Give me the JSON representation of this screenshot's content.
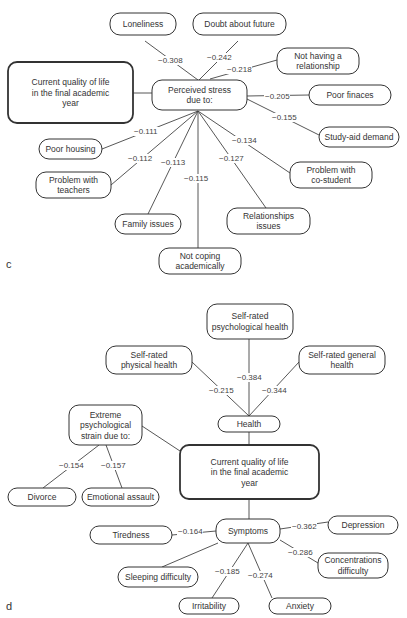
{
  "panels": [
    {
      "id": "c",
      "letter": "c",
      "letter_pos": [
        6,
        268
      ],
      "nodes": [
        {
          "id": "qol",
          "lines": [
            "Current quality of life",
            "in the final academic",
            "year"
          ],
          "x": 8,
          "y": 62,
          "w": 125,
          "h": 61,
          "main": true
        },
        {
          "id": "stress",
          "lines": [
            "Perceived stress",
            "due to:"
          ],
          "x": 152,
          "y": 80,
          "w": 95,
          "h": 30
        },
        {
          "id": "lone",
          "lines": [
            "Loneliness"
          ],
          "x": 110,
          "y": 13,
          "w": 66,
          "h": 22
        },
        {
          "id": "doubt",
          "lines": [
            "Doubt about future"
          ],
          "x": 193,
          "y": 13,
          "w": 93,
          "h": 22
        },
        {
          "id": "norel",
          "lines": [
            "Not having a",
            "relationship"
          ],
          "x": 277,
          "y": 48,
          "w": 82,
          "h": 26
        },
        {
          "id": "fin",
          "lines": [
            "Poor finaces"
          ],
          "x": 309,
          "y": 85,
          "w": 82,
          "h": 20
        },
        {
          "id": "aid",
          "lines": [
            "Study-aid demand"
          ],
          "x": 319,
          "y": 127,
          "w": 80,
          "h": 20
        },
        {
          "id": "house",
          "lines": [
            "Poor housing"
          ],
          "x": 39,
          "y": 139,
          "w": 63,
          "h": 20
        },
        {
          "id": "teach",
          "lines": [
            "Problem with",
            "teachers"
          ],
          "x": 36,
          "y": 172,
          "w": 75,
          "h": 26
        },
        {
          "id": "fam",
          "lines": [
            "Family issues"
          ],
          "x": 115,
          "y": 214,
          "w": 66,
          "h": 20
        },
        {
          "id": "rel",
          "lines": [
            "Relationships",
            "issues"
          ],
          "x": 227,
          "y": 208,
          "w": 83,
          "h": 26
        },
        {
          "id": "costu",
          "lines": [
            "Problem with",
            "co-student"
          ],
          "x": 290,
          "y": 162,
          "w": 82,
          "h": 26
        },
        {
          "id": "cope",
          "lines": [
            "Not coping",
            "academically"
          ],
          "x": 159,
          "y": 248,
          "w": 82,
          "h": 26
        }
      ],
      "edges": [
        {
          "from": "qol",
          "to": "stress",
          "points": [
            [
              133,
              93
            ],
            [
              152,
              93
            ]
          ],
          "weight": ""
        },
        {
          "points": [
            [
              145,
              41
            ],
            [
              198,
              80
            ]
          ],
          "weight": "−0.308",
          "wpos": [
            158,
            63
          ]
        },
        {
          "points": [
            [
              238,
              41
            ],
            [
              199,
              80
            ]
          ],
          "weight": "−0.242",
          "wpos": [
            207,
            60
          ]
        },
        {
          "points": [
            [
              277,
              60
            ],
            [
              210,
              79
            ]
          ],
          "weight": "−0.218",
          "wpos": [
            227,
            72
          ]
        },
        {
          "points": [
            [
              247,
              96
            ],
            [
              309,
              95
            ]
          ],
          "weight": "−0.205",
          "wpos": [
            265,
            99
          ]
        },
        {
          "points": [
            [
              247,
              99
            ],
            [
              319,
              135
            ]
          ],
          "weight": "−0.155",
          "wpos": [
            272,
            120
          ]
        },
        {
          "points": [
            [
              198,
              111
            ],
            [
              102,
              149
            ]
          ],
          "weight": "−0.111",
          "wpos": [
            134,
            134
          ]
        },
        {
          "points": [
            [
              198,
              111
            ],
            [
              111,
              185
            ]
          ],
          "weight": "−0.112",
          "wpos": [
            128,
            161
          ]
        },
        {
          "points": [
            [
              198,
              111
            ],
            [
              148,
              214
            ]
          ],
          "weight": "−0.113",
          "wpos": [
            161,
            165
          ]
        },
        {
          "points": [
            [
              198,
              111
            ],
            [
              198,
              248
            ]
          ],
          "weight": "−0.115",
          "wpos": [
            184,
            181
          ]
        },
        {
          "points": [
            [
              198,
              111
            ],
            [
              266,
              208
            ]
          ],
          "weight": "−0.127",
          "wpos": [
            219,
            161
          ]
        },
        {
          "points": [
            [
              198,
              111
            ],
            [
              290,
              173
            ]
          ],
          "weight": "−0.134",
          "wpos": [
            232,
            143
          ]
        }
      ]
    },
    {
      "id": "d",
      "letter": "d",
      "letter_pos": [
        6,
        610
      ],
      "nodes": [
        {
          "id": "psy",
          "lines": [
            "Self-rated",
            "psychological health"
          ],
          "x": 207,
          "y": 304,
          "w": 86,
          "h": 35
        },
        {
          "id": "phys",
          "lines": [
            "Self-rated",
            "physical health"
          ],
          "x": 106,
          "y": 346,
          "w": 86,
          "h": 28
        },
        {
          "id": "gen",
          "lines": [
            "Self-rated general",
            "health"
          ],
          "x": 299,
          "y": 346,
          "w": 86,
          "h": 28
        },
        {
          "id": "health",
          "lines": [
            "Health"
          ],
          "x": 218,
          "y": 416,
          "w": 62,
          "h": 16
        },
        {
          "id": "strain",
          "lines": [
            "Extreme",
            "psychological",
            "strain due to:"
          ],
          "x": 69,
          "y": 405,
          "w": 73,
          "h": 40
        },
        {
          "id": "qol2",
          "lines": [
            "Current quality of life",
            "in the final academic",
            "year"
          ],
          "x": 180,
          "y": 445,
          "w": 139,
          "h": 54,
          "main": true
        },
        {
          "id": "div",
          "lines": [
            "Divorce"
          ],
          "x": 8,
          "y": 488,
          "w": 68,
          "h": 18
        },
        {
          "id": "emo",
          "lines": [
            "Emotional assault"
          ],
          "x": 82,
          "y": 488,
          "w": 77,
          "h": 18
        },
        {
          "id": "symp",
          "lines": [
            "Symptoms"
          ],
          "x": 216,
          "y": 519,
          "w": 64,
          "h": 24
        },
        {
          "id": "tired",
          "lines": [
            "Tiredness"
          ],
          "x": 90,
          "y": 526,
          "w": 82,
          "h": 18
        },
        {
          "id": "dep",
          "lines": [
            "Depression"
          ],
          "x": 328,
          "y": 516,
          "w": 70,
          "h": 18
        },
        {
          "id": "conc",
          "lines": [
            "Concentrations",
            "difficulty"
          ],
          "x": 318,
          "y": 553,
          "w": 70,
          "h": 25
        },
        {
          "id": "sleep",
          "lines": [
            "Sleeping difficulty"
          ],
          "x": 118,
          "y": 567,
          "w": 80,
          "h": 20
        },
        {
          "id": "irr",
          "lines": [
            "Irritability"
          ],
          "x": 179,
          "y": 598,
          "w": 60,
          "h": 16
        },
        {
          "id": "anx",
          "lines": [
            "Anxiety"
          ],
          "x": 269,
          "y": 598,
          "w": 62,
          "h": 16
        }
      ],
      "edges": [
        {
          "points": [
            [
              249,
              339
            ],
            [
              249,
              416
            ]
          ],
          "weight": "−0.384",
          "wpos": [
            237,
            380
          ]
        },
        {
          "points": [
            [
              192,
              362
            ],
            [
              249,
              416
            ]
          ],
          "weight": "−0.215",
          "wpos": [
            209,
            393
          ]
        },
        {
          "points": [
            [
              299,
              362
            ],
            [
              249,
              416
            ]
          ],
          "weight": "−0.344",
          "wpos": [
            262,
            393
          ]
        },
        {
          "points": [
            [
              249,
              432
            ],
            [
              249,
              445
            ]
          ],
          "weight": ""
        },
        {
          "points": [
            [
              142,
              426
            ],
            [
              180,
              451
            ]
          ],
          "weight": ""
        },
        {
          "points": [
            [
              99,
              445
            ],
            [
              43,
              488
            ]
          ],
          "weight": "−0.154",
          "wpos": [
            59,
            468
          ]
        },
        {
          "points": [
            [
              106,
              445
            ],
            [
              122,
              488
            ]
          ],
          "weight": "−0.157",
          "wpos": [
            101,
            468
          ]
        },
        {
          "points": [
            [
              249,
              499
            ],
            [
              249,
              519
            ]
          ],
          "weight": ""
        },
        {
          "points": [
            [
              172,
              535
            ],
            [
              216,
              531
            ]
          ],
          "weight": "−0.164",
          "wpos": [
            178,
            534
          ]
        },
        {
          "points": [
            [
              280,
              529
            ],
            [
              328,
              522
            ]
          ],
          "weight": "−0.362",
          "wpos": [
            292,
            529
          ]
        },
        {
          "points": [
            [
              280,
              540
            ],
            [
              318,
              563
            ]
          ],
          "weight": "−0.286",
          "wpos": [
            288,
            555
          ]
        },
        {
          "points": [
            [
              218,
              543
            ],
            [
              162,
              567
            ]
          ],
          "weight": ""
        },
        {
          "points": [
            [
              248,
              543
            ],
            [
              212,
              598
            ]
          ],
          "weight": "−0.185",
          "wpos": [
            215,
            574
          ]
        },
        {
          "points": [
            [
              248,
              543
            ],
            [
              272,
              598
            ]
          ],
          "weight": "−0.274",
          "wpos": [
            248,
            578
          ]
        }
      ]
    }
  ]
}
